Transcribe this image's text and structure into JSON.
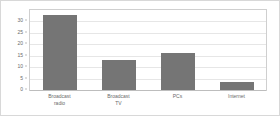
{
  "chart_data": {
    "type": "bar",
    "title": "",
    "subtitle": "",
    "xlabel": "",
    "ylabel": "",
    "categories": [
      "Broadcast\nradio",
      "Broadcast\nTV",
      "PCs",
      "Internet"
    ],
    "values": [
      33,
      13,
      16,
      3.5
    ],
    "ylim": [
      0,
      35
    ],
    "yticks": [
      0,
      5,
      10,
      15,
      20,
      25,
      30
    ],
    "ytick_labels": [
      "0",
      "5",
      "10",
      "15",
      "20",
      "25",
      "30"
    ],
    "grid": true,
    "legend": false,
    "legend_position": "none",
    "series": [
      {
        "name": "",
        "values": [
          33,
          13,
          16,
          3.5
        ]
      }
    ]
  },
  "style": {
    "bar_color": "#757575",
    "grid_color": "#e6e6e6",
    "axis_color": "#bdbdbd",
    "text_color": "#6b6b6b",
    "background": "#ffffff",
    "frame_color": "#cfcfcf"
  }
}
